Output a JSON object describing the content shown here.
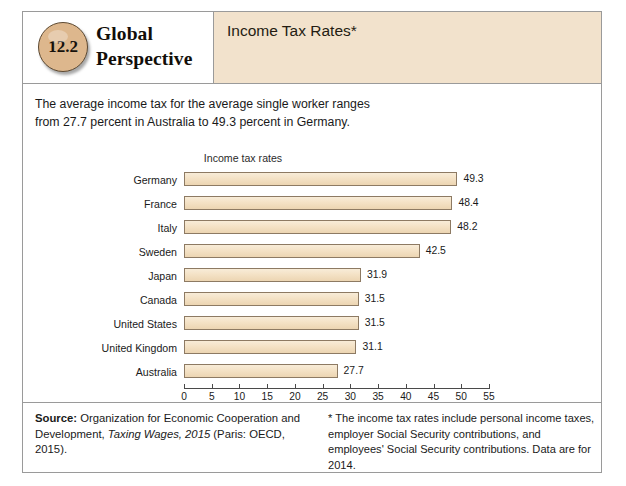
{
  "figure": {
    "badge_number": "12.2",
    "brand_line1": "Global",
    "brand_line2": "Perspective",
    "title": "Income Tax Rates*",
    "intro": "The average income tax for the average single worker ranges from 27.7 percent in Australia to 49.3 percent in Germany.",
    "source_label": "Source:",
    "source_text_1": " Organization for Economic Cooperation and Development, ",
    "source_italic": "Taxing Wages, 2015",
    "source_text_2": " (Paris: OECD, 2015).",
    "footnote": "* The income tax rates include personal income taxes, employer Social Security contributions, and employees' Social Security contributions. Data are for 2014."
  },
  "chart_data": {
    "type": "bar",
    "orientation": "horizontal",
    "title": "Income tax rates",
    "xlabel": "",
    "ylabel": "",
    "xlim": [
      0,
      55
    ],
    "xticks": [
      0,
      5,
      10,
      15,
      20,
      25,
      30,
      35,
      40,
      45,
      50,
      55
    ],
    "grid": false,
    "legend": false,
    "categories": [
      "Germany",
      "France",
      "Italy",
      "Sweden",
      "Japan",
      "Canada",
      "United States",
      "United Kingdom",
      "Australia"
    ],
    "values": [
      49.3,
      48.4,
      48.2,
      42.5,
      31.9,
      31.5,
      31.5,
      31.1,
      27.7
    ],
    "value_labels": [
      "49.3",
      "48.4",
      "48.2",
      "42.5",
      "31.9",
      "31.5",
      "31.5",
      "31.1",
      "27.7"
    ],
    "bar_color": "#f4e2c6",
    "bar_border": "#8d7a63"
  },
  "colors": {
    "badge": "#ddb78d",
    "header_strip": "#f2e2cc",
    "border": "#9a9a9a"
  }
}
